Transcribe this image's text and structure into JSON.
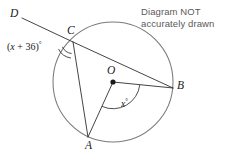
{
  "note": {
    "line1": "Diagram NOT",
    "line2": "accurately drawn"
  },
  "labels": {
    "point_d": "D",
    "point_c": "C",
    "point_b": "B",
    "point_a": "A",
    "point_o": "O"
  },
  "angles": {
    "at_c_prefix": "(",
    "at_c_var": "x",
    "at_c_mid": " + 36)",
    "at_c_degree": "°",
    "at_c_full": "(x + 36)°",
    "at_o_var": "x",
    "at_o_degree": "°",
    "at_o_full": "x°"
  },
  "colors": {
    "stroke": "#3a3a3a",
    "circle_stroke": "#7a7a7a",
    "text": "#1a1a1a",
    "note_text": "#5a5a5a",
    "background": "#ffffff"
  },
  "geometry": {
    "circle": {
      "cx": 113,
      "cy": 82,
      "r": 60
    },
    "points": {
      "A": {
        "x": 88,
        "y": 137
      },
      "B": {
        "x": 173,
        "y": 88
      },
      "C": {
        "x": 73,
        "y": 42
      },
      "D": {
        "x": 22,
        "y": 18
      },
      "O": {
        "x": 113,
        "y": 82
      }
    }
  }
}
